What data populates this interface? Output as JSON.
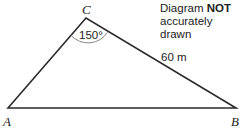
{
  "note": {
    "line1_prefix": "Diagram ",
    "line1_bold": "NOT",
    "line2": "accurately drawn"
  },
  "vertices": {
    "A": "A",
    "B": "B",
    "C": "C"
  },
  "angle_label": "150°",
  "side_label": "60 m",
  "colors": {
    "line": "#2a2a2a",
    "arc": "#888888"
  }
}
